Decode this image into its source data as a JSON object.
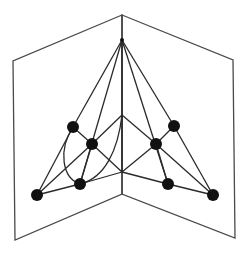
{
  "diagram": {
    "title": "",
    "colors": {
      "frame": "#4a4a4a",
      "edge": "#2a2a2a",
      "node": "#111111",
      "background": "#ffffff"
    },
    "frame": {
      "spine_top": [
        122,
        15
      ],
      "spine_bottom": [
        122,
        194
      ],
      "left_page": [
        [
          122,
          15
        ],
        [
          13,
          61
        ],
        [
          15,
          240
        ],
        [
          122,
          194
        ]
      ],
      "right_page": [
        [
          122,
          15
        ],
        [
          233,
          60
        ],
        [
          235,
          238
        ],
        [
          122,
          194
        ]
      ]
    },
    "nodes": [
      {
        "id": "apex",
        "x": 122,
        "y": 40,
        "r": 2
      },
      {
        "id": "spine-mid-upper",
        "x": 122,
        "y": 115,
        "r": 0
      },
      {
        "id": "spine-mid-lower",
        "x": 122,
        "y": 172,
        "r": 0
      },
      {
        "id": "left-outer",
        "x": 73,
        "y": 127,
        "r": 6
      },
      {
        "id": "left-inner",
        "x": 92,
        "y": 144,
        "r": 6
      },
      {
        "id": "left-bottom",
        "x": 80,
        "y": 184,
        "r": 6
      },
      {
        "id": "left-far",
        "x": 37,
        "y": 195,
        "r": 6
      },
      {
        "id": "right-outer",
        "x": 174,
        "y": 126,
        "r": 6
      },
      {
        "id": "right-inner",
        "x": 156,
        "y": 144,
        "r": 6
      },
      {
        "id": "right-bottom",
        "x": 168,
        "y": 184,
        "r": 6
      },
      {
        "id": "right-far",
        "x": 213,
        "y": 195,
        "r": 6
      }
    ],
    "edges": [
      {
        "from": "apex",
        "to": "left-outer"
      },
      {
        "from": "apex",
        "to": "left-bottom"
      },
      {
        "from": "apex",
        "to": "spine-mid-upper"
      },
      {
        "from": "apex",
        "to": "right-bottom"
      },
      {
        "from": "apex",
        "to": "right-outer"
      },
      {
        "from": "spine-mid-upper",
        "to": "spine-mid-lower"
      },
      {
        "from": "spine-mid-upper",
        "to": "left-inner"
      },
      {
        "from": "spine-mid-upper",
        "to": "right-inner"
      },
      {
        "from": "left-outer",
        "to": "left-inner"
      },
      {
        "from": "left-inner",
        "to": "left-bottom"
      },
      {
        "from": "left-inner",
        "to": "spine-mid-lower"
      },
      {
        "from": "left-far",
        "to": "left-outer"
      },
      {
        "from": "left-far",
        "to": "left-inner"
      },
      {
        "from": "left-far",
        "to": "left-bottom"
      },
      {
        "from": "left-bottom",
        "to": "spine-mid-lower"
      },
      {
        "from": "right-outer",
        "to": "right-inner"
      },
      {
        "from": "right-inner",
        "to": "right-bottom"
      },
      {
        "from": "right-inner",
        "to": "spine-mid-lower"
      },
      {
        "from": "right-far",
        "to": "right-outer"
      },
      {
        "from": "right-far",
        "to": "right-inner"
      },
      {
        "from": "right-far",
        "to": "right-bottom"
      },
      {
        "from": "right-bottom",
        "to": "spine-mid-lower"
      }
    ],
    "curves": [
      {
        "from": "left-outer",
        "to": "left-bottom",
        "path": "M73,127 C58,150 62,178 80,184"
      },
      {
        "from": "spine-mid-upper",
        "to": "left-bottom",
        "path": "M122,115 C118,150 105,178 80,184"
      }
    ]
  }
}
